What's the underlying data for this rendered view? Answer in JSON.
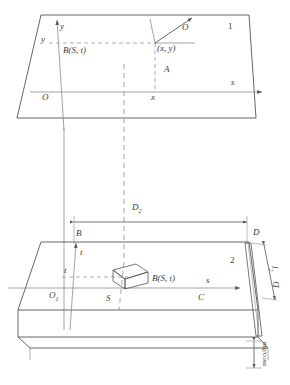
{
  "figure": {
    "type": "engineering-projection-diagram"
  },
  "plane_upper": {
    "id_label": "1",
    "origin_label": "O",
    "axis_x_label": "x",
    "axis_y_label": "y",
    "axis_y_tick_label": "y",
    "axis_s_label": "s",
    "point_label": "(x, y)",
    "point_marker_label": "A",
    "vector_label": "O",
    "block_label": "B(S, t)"
  },
  "plane_lower": {
    "id_label": "2",
    "origin_label": "O",
    "origin_sub": "1",
    "axis_s_label": "s",
    "axis_t_label": "t",
    "axis_t_tick_label": "t",
    "corner_b": "B",
    "corner_c": "C",
    "corner_d": "D",
    "foot_label": "S",
    "block_label": "B(S, t)"
  },
  "dimensions": {
    "horizontal_span": "D",
    "horizontal_span_sub": "2",
    "edge_height": "l",
    "edge_height_sub": "2",
    "edge_depth": "D",
    "thickness_note": "mg/cosα"
  },
  "colors": {
    "line": "#55555a",
    "line_light": "#8b8b90",
    "dashed": "#9a9a9e",
    "text": "#3a3a3a"
  }
}
